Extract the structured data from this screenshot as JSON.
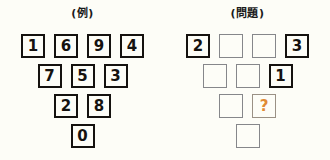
{
  "page": {
    "background_color": "#fdfdf7",
    "filled_border_color": "#15120f",
    "empty_border_color": "#86878a",
    "unknown_text_color": "#e08a35"
  },
  "panels": [
    {
      "key": "example",
      "title": "(例)",
      "rows": [
        {
          "cells": [
            {
              "value": "1",
              "state": "filled"
            },
            {
              "value": "6",
              "state": "filled"
            },
            {
              "value": "9",
              "state": "filled"
            },
            {
              "value": "4",
              "state": "filled"
            }
          ]
        },
        {
          "cells": [
            {
              "value": "7",
              "state": "filled"
            },
            {
              "value": "5",
              "state": "filled"
            },
            {
              "value": "3",
              "state": "filled"
            }
          ]
        },
        {
          "cells": [
            {
              "value": "2",
              "state": "filled"
            },
            {
              "value": "8",
              "state": "filled"
            }
          ]
        },
        {
          "cells": [
            {
              "value": "0",
              "state": "filled"
            }
          ]
        }
      ]
    },
    {
      "key": "question",
      "title": "(問題)",
      "rows": [
        {
          "cells": [
            {
              "value": "2",
              "state": "filled"
            },
            {
              "value": "",
              "state": "empty"
            },
            {
              "value": "",
              "state": "empty"
            },
            {
              "value": "3",
              "state": "filled"
            }
          ]
        },
        {
          "cells": [
            {
              "value": "",
              "state": "empty"
            },
            {
              "value": "",
              "state": "empty"
            },
            {
              "value": "1",
              "state": "filled"
            }
          ]
        },
        {
          "cells": [
            {
              "value": "",
              "state": "empty"
            },
            {
              "value": "?",
              "state": "unknown"
            }
          ]
        },
        {
          "cells": [
            {
              "value": "",
              "state": "empty"
            }
          ]
        }
      ]
    }
  ]
}
